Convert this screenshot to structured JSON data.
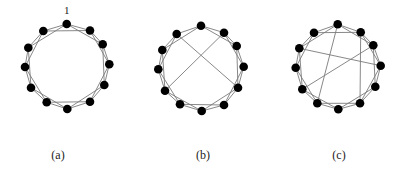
{
  "figure": {
    "node_color": "#000000",
    "edge_color": "#7a7a7a",
    "node_radius": 4.3,
    "panels": [
      {
        "id": "a",
        "caption": "(a)",
        "caption_pos": [
          58,
          148
        ],
        "node_label": {
          "text": "1",
          "x": 64,
          "y": 14
        },
        "nodes": [
          [
            66.7,
            24
          ],
          [
            90,
            30.5
          ],
          [
            102.7,
            44.3
          ],
          [
            109.3,
            64.3
          ],
          [
            104.3,
            85
          ],
          [
            90,
            101.7
          ],
          [
            67.3,
            109
          ],
          [
            46.7,
            102.3
          ],
          [
            31,
            87.7
          ],
          [
            25,
            67
          ],
          [
            28.3,
            47.7
          ],
          [
            43.3,
            31
          ]
        ],
        "edges": [
          [
            0,
            1
          ],
          [
            1,
            2
          ],
          [
            2,
            3
          ],
          [
            3,
            4
          ],
          [
            4,
            5
          ],
          [
            5,
            6
          ],
          [
            6,
            7
          ],
          [
            7,
            8
          ],
          [
            8,
            9
          ],
          [
            9,
            10
          ],
          [
            10,
            11
          ],
          [
            11,
            0
          ],
          [
            0,
            2
          ],
          [
            1,
            3
          ],
          [
            2,
            4
          ],
          [
            3,
            5
          ],
          [
            4,
            6
          ],
          [
            5,
            7
          ],
          [
            6,
            8
          ],
          [
            7,
            9
          ],
          [
            8,
            10
          ],
          [
            9,
            11
          ],
          [
            10,
            0
          ],
          [
            11,
            1
          ]
        ]
      },
      {
        "id": "b",
        "caption": "(b)",
        "caption_pos": [
          203,
          148
        ],
        "nodes": [
          [
            201,
            25.7
          ],
          [
            224,
            32.7
          ],
          [
            236.7,
            46
          ],
          [
            243.7,
            66.7
          ],
          [
            238,
            87.7
          ],
          [
            224,
            105
          ],
          [
            201.7,
            111
          ],
          [
            180,
            104.3
          ],
          [
            165,
            90.7
          ],
          [
            158.3,
            69.3
          ],
          [
            162.3,
            50
          ],
          [
            176.7,
            34
          ]
        ],
        "edges": [
          [
            0,
            1
          ],
          [
            1,
            2
          ],
          [
            2,
            3
          ],
          [
            3,
            4
          ],
          [
            4,
            5
          ],
          [
            5,
            6
          ],
          [
            6,
            7
          ],
          [
            7,
            8
          ],
          [
            8,
            9
          ],
          [
            9,
            10
          ],
          [
            10,
            11
          ],
          [
            11,
            0
          ],
          [
            0,
            2
          ],
          [
            1,
            3
          ],
          [
            2,
            4
          ],
          [
            3,
            5
          ],
          [
            4,
            6
          ],
          [
            5,
            7
          ],
          [
            6,
            8
          ],
          [
            7,
            9
          ],
          [
            8,
            10
          ],
          [
            9,
            11
          ],
          [
            10,
            0
          ],
          [
            11,
            4
          ],
          [
            1,
            8
          ]
        ]
      },
      {
        "id": "c",
        "caption": "(c)",
        "caption_pos": [
          339,
          148
        ],
        "nodes": [
          [
            337.7,
            24.3
          ],
          [
            360.7,
            32.3
          ],
          [
            373.3,
            45.3
          ],
          [
            380.7,
            65.7
          ],
          [
            375.3,
            86.7
          ],
          [
            360,
            103.3
          ],
          [
            338.3,
            109.3
          ],
          [
            317.3,
            103.3
          ],
          [
            302.3,
            89.3
          ],
          [
            295.7,
            67.7
          ],
          [
            299.3,
            48.3
          ],
          [
            314,
            32.7
          ]
        ],
        "edges": [
          [
            0,
            1
          ],
          [
            1,
            2
          ],
          [
            2,
            3
          ],
          [
            3,
            4
          ],
          [
            4,
            5
          ],
          [
            5,
            6
          ],
          [
            6,
            7
          ],
          [
            7,
            8
          ],
          [
            8,
            9
          ],
          [
            9,
            10
          ],
          [
            10,
            11
          ],
          [
            11,
            0
          ],
          [
            0,
            2
          ],
          [
            1,
            3
          ],
          [
            2,
            4
          ],
          [
            4,
            6
          ],
          [
            5,
            7
          ],
          [
            7,
            9
          ],
          [
            8,
            10
          ],
          [
            9,
            11
          ],
          [
            10,
            0
          ],
          [
            11,
            1
          ],
          [
            3,
            5
          ],
          [
            6,
            8
          ],
          [
            10,
            3
          ],
          [
            2,
            8
          ],
          [
            0,
            7
          ],
          [
            1,
            5
          ]
        ]
      }
    ]
  }
}
